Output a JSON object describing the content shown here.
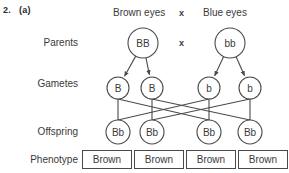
{
  "question": {
    "number": "2.",
    "part": "(a)"
  },
  "header": {
    "left_trait": "Brown eyes",
    "cross_symbol": "x",
    "right_trait": "Blue eyes"
  },
  "row_labels": {
    "parents": "Parents",
    "gametes": "Gametes",
    "offspring": "Offspring",
    "phenotype": "Phenotype"
  },
  "cross_symbols": {
    "top": "x",
    "middle": "x"
  },
  "parents": [
    {
      "genotype": "BB",
      "cx": 143,
      "cy": 43
    },
    {
      "genotype": "bb",
      "cx": 230,
      "cy": 43
    }
  ],
  "gametes": [
    {
      "allele": "B",
      "cx": 118,
      "cy": 88
    },
    {
      "allele": "B",
      "cx": 152,
      "cy": 88
    },
    {
      "allele": "b",
      "cx": 209,
      "cy": 88
    },
    {
      "allele": "b",
      "cx": 250,
      "cy": 88
    }
  ],
  "offspring": [
    {
      "genotype": "Bb",
      "cx": 118,
      "cy": 132
    },
    {
      "genotype": "Bb",
      "cx": 152,
      "cy": 132
    },
    {
      "genotype": "Bb",
      "cx": 209,
      "cy": 132
    },
    {
      "genotype": "Bb",
      "cx": 250,
      "cy": 132
    }
  ],
  "phenotypes": [
    {
      "label": "Brown",
      "left": 82,
      "width": 50
    },
    {
      "label": "Brown",
      "left": 134,
      "width": 50
    },
    {
      "label": "Brown",
      "left": 186,
      "width": 50
    },
    {
      "label": "Brown",
      "left": 238,
      "width": 50
    }
  ],
  "colors": {
    "background": "#ffffff",
    "ink": "#3a3a3a",
    "line": "#4a4a4a"
  }
}
